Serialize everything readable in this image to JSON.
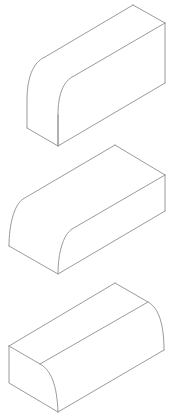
{
  "canvas": {
    "width": 174,
    "height": 420,
    "background": "#ffffff"
  },
  "style": {
    "stroke_color": "#8f8f8f"
  },
  "figures": [
    {
      "name": "block-rounded-front-top-edge",
      "description": "Isometric block, tall orientation, rounded edge along front-top",
      "paths": {
        "outer_profile": "M 27 128 L 27 100 C 27 78 33 62 45 57 L 133 5",
        "inner_profile": "M 58 146 L 58 115 C 58 95 63 81 74 76 L 165 23",
        "top_back": "M 133 5 L 165 23",
        "right_back": "M 165 23 L 165 83",
        "bottom": "M 27 128 L 58 146 L 165 83",
        "front_face_divider": "M 58 146 L 58 115"
      }
    },
    {
      "name": "block-rounded-front-left-edge",
      "description": "Isometric block, flatter orientation, rounded edge along front",
      "paths": {
        "outer_profile": "M 9 246 C 9 225 14 205 23 199 L 115 145",
        "inner_profile": "M 58 274 C 58 253 63 235 72 229 L 165 175",
        "top_back": "M 115 145 L 165 175",
        "right_back": "M 165 175 L 165 211",
        "bottom": "M 9 246 L 58 274 L 165 211"
      }
    },
    {
      "name": "block-rounded-top-right-edge",
      "description": "Isometric block, rounded edge along top-right",
      "paths": {
        "left_face": "M 9 346 L 9 383 L 58 412",
        "front_curve": "M 9 346 L 40 364 C 51 370 57 385 58 412",
        "top_edge": "M 9 346 L 115 283",
        "back_curve": "M 115 283 L 148 302 C 159 308 164 325 164 350",
        "bottom_right": "M 58 412 L 164 350",
        "ridge": "M 40 364 L 148 302"
      }
    }
  ]
}
